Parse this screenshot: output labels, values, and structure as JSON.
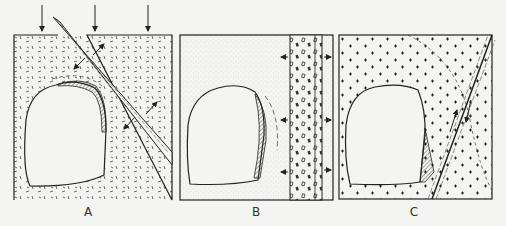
{
  "figure": {
    "panels": [
      {
        "id": "A",
        "label": "A",
        "description": "Opening with overbreak (hatched) near a sheared dike under vertical load; arrows indicate stress"
      },
      {
        "id": "B",
        "label": "B",
        "description": "Opening with overbreak adjacent to a vertical band of coarse material; horizontal arrows indicate swelling/pressure"
      },
      {
        "id": "C",
        "label": "C",
        "description": "Opening with overbreak near an inclined fault in crossed-pattern rock; half-arrows indicate shear sense"
      }
    ],
    "colors": {
      "ink": "#222222",
      "background": "#f4f4f2",
      "stipple": "#9a9a9a"
    }
  }
}
